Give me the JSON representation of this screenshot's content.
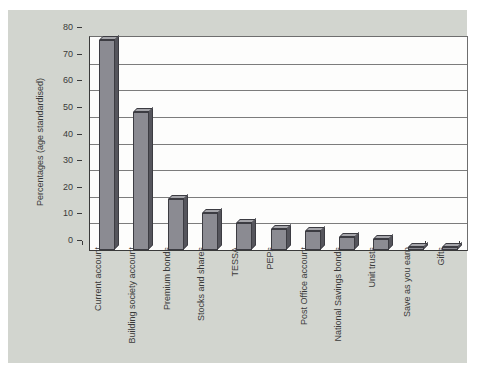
{
  "chart_data": {
    "type": "bar",
    "title": "",
    "xlabel": "",
    "ylabel": "Percentages (age standardised)",
    "categories": [
      "Current account",
      "Building society account",
      "Premium bonds",
      "Stocks and shares",
      "TESSA",
      "PEPs",
      "Post Office account",
      "National Savings bonds",
      "Unit trusts",
      "Save as you earn",
      "Gifts"
    ],
    "values": [
      79,
      52,
      19,
      14,
      10,
      8,
      7,
      5,
      4,
      1,
      1
    ],
    "ylim": [
      0,
      80
    ],
    "yticks": [
      0,
      10,
      20,
      30,
      40,
      50,
      60,
      70,
      80
    ],
    "grid": true,
    "legend": false,
    "style": "3d-column"
  },
  "colors": {
    "panel_bg": "#d2d5cf",
    "plot_bg": "#fdfdfc",
    "bar_front": "#8b8b92",
    "bar_side": "#55555c",
    "bar_top": "#a5a5aa",
    "bar_outline": "#3c3c42",
    "gridline": "#7c7c7c",
    "axis": "#3a3a3a",
    "text": "#3a3a3a"
  }
}
